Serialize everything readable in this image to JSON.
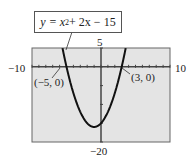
{
  "chart_data": {
    "type": "line",
    "title": "",
    "equation": "y = x^2 + 2x - 15",
    "equation_parts": {
      "lhs": "y = x",
      "exp": "2",
      "rest": " + 2x − 15"
    },
    "xlim": [
      -10,
      10
    ],
    "ylim": [
      -20,
      5
    ],
    "xtick_step": 1,
    "ytick_step": 5,
    "grid": false,
    "tick_labels": {
      "xmin": "−10",
      "xmax": "10",
      "ymax": "5",
      "ymin": "−20"
    },
    "annotations": [
      {
        "label": "(−5, 0)",
        "x": -5,
        "y": 0
      },
      {
        "label": "(3, 0)",
        "x": 3,
        "y": 0
      }
    ],
    "vertex": {
      "x": -1,
      "y": -16
    },
    "x": [
      -6,
      -5,
      -4,
      -3,
      -2,
      -1,
      0,
      1,
      2,
      3,
      4
    ],
    "series": [
      {
        "name": "y = x^2 + 2x - 15",
        "values": [
          9,
          0,
          -7,
          -12,
          -15,
          -16,
          -15,
          -12,
          -7,
          0,
          9
        ]
      }
    ],
    "background": "#e6e6e6",
    "curve_color": "#111111"
  }
}
